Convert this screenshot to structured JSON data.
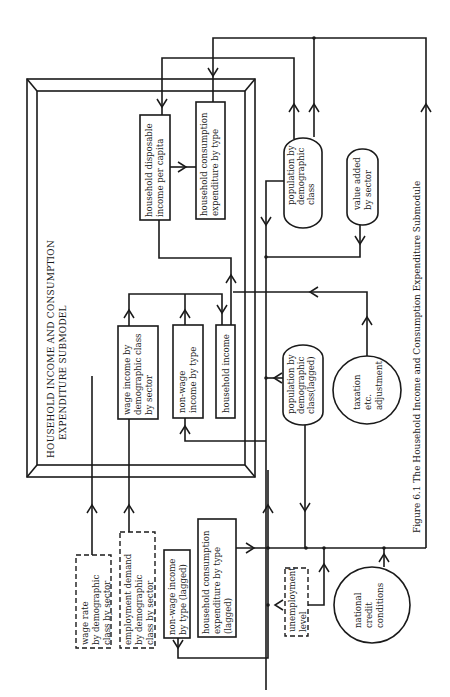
{
  "figure": {
    "caption": "Figure 6.1  The Household Income and Consumption Expenditure Submodule",
    "orientation": "rotated 90° counter-clockwise"
  },
  "submodel": {
    "title_line1": "HOUSEHOLD INCOME AND CONSUMPTION",
    "title_line2": "EXPENDITURE SUBMODEL"
  },
  "nodes": {
    "hh_disposable_income": {
      "line1": "household disposable",
      "line2": "income per capita",
      "shape": "rectangle"
    },
    "hh_consumption": {
      "line1": "household consumption",
      "line2": "expenditure by type",
      "shape": "rectangle"
    },
    "wage_income": {
      "line1": "wage income by",
      "line2": "demographic class",
      "line3": "by sector",
      "shape": "rectangle"
    },
    "non_wage_income": {
      "line1": "non-wage",
      "line2": "income by type",
      "shape": "rectangle"
    },
    "household_income": {
      "line1": "household income",
      "shape": "rectangle"
    },
    "population": {
      "line1": "population by",
      "line2": "demographic",
      "line3": "class",
      "shape": "rounded"
    },
    "value_added": {
      "line1": "value added",
      "line2": "by sector",
      "shape": "rounded"
    },
    "population_lagged": {
      "line1": "population by",
      "line2": "demographic",
      "line3": "class(lagged)",
      "shape": "rounded"
    },
    "taxation": {
      "line1": "taxation",
      "line2": "etc.",
      "line3": "adjustment",
      "shape": "circle"
    },
    "wage_rate": {
      "line1": "wage rate",
      "line2": "by demographic",
      "line3": "class by sector",
      "shape": "dashed-rectangle"
    },
    "employment_demand": {
      "line1": "employment demand",
      "line2": "by demographic",
      "line3": "class by sector",
      "shape": "dashed-rectangle"
    },
    "non_wage_lagged": {
      "line1": "non-wage income",
      "line2": "by type (lagged)",
      "shape": "rectangle"
    },
    "hh_consumption_lagged": {
      "line1": "household consumption",
      "line2": "expenditure by type",
      "line3": "(lagged)",
      "shape": "rectangle"
    },
    "unemployment": {
      "line1": "unemployment",
      "line2": "level",
      "shape": "dashed-rectangle"
    },
    "credit": {
      "line1": "national",
      "line2": "credit",
      "line3": "conditions",
      "shape": "circle"
    }
  },
  "colors": {
    "ink": "#1a1a1a",
    "paper": "#ffffff"
  }
}
